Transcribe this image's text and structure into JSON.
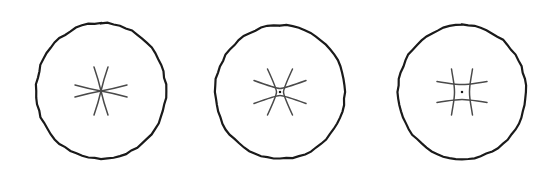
{
  "figure": {
    "title": "",
    "caption": "",
    "width": 553,
    "height": 171,
    "background_color": "#ffffff",
    "stroke_color": "#1a1a1a",
    "inner_stroke_color": "#4a4a4a",
    "outline_stroke_width": 2.1,
    "inner_stroke_width": 1.5,
    "panel_count": 3,
    "labels": [],
    "panels": [
      {
        "id": "panel-1",
        "name": "circle-with-pinched-star",
        "order": 1,
        "outline": {
          "shape": "circle",
          "cx": 101,
          "cy": 91,
          "rx": 65,
          "ry": 68,
          "stroke_width": 2.2,
          "stroke_color": "#1a1a1a",
          "fill": "none"
        },
        "inner_mark": {
          "kind": "pinched-star",
          "cx": 101,
          "cy": 91,
          "vertical_lines": 2,
          "horizontal_lines": 2,
          "cell_width": 0,
          "cell_height": 0,
          "center_dot": false,
          "vertical_half_length": 24,
          "horizontal_half_length": 26,
          "vertical_spread": 7,
          "horizontal_spread": 6,
          "stroke_width": 1.5,
          "stroke_color": "#4a4a4a",
          "description": "two curved vertical strokes pinching to a single waist crossed by two curved horizontal strokes"
        }
      },
      {
        "id": "panel-2",
        "name": "circle-with-small-grid",
        "order": 2,
        "outline": {
          "shape": "circle",
          "cx": 280,
          "cy": 92,
          "rx": 65,
          "ry": 67,
          "stroke_width": 2.2,
          "stroke_color": "#1a1a1a",
          "fill": "none"
        },
        "inner_mark": {
          "kind": "grid-with-dot",
          "cx": 280,
          "cy": 92,
          "vertical_lines": 2,
          "horizontal_lines": 2,
          "cell_width": 7,
          "cell_height": 7,
          "center_dot": true,
          "center_dot_size": 2.2,
          "vertical_half_length": 23,
          "horizontal_half_length": 26,
          "vertical_spread": 9,
          "horizontal_spread": 8,
          "stroke_width": 1.5,
          "stroke_color": "#4a4a4a",
          "description": "tight hash of two curved verticals and two curved horizontals enclosing a small central cell with a dot"
        }
      },
      {
        "id": "panel-3",
        "name": "circle-with-open-grid",
        "order": 3,
        "outline": {
          "shape": "circle",
          "cx": 462,
          "cy": 92,
          "rx": 64,
          "ry": 67,
          "stroke_width": 2.2,
          "stroke_color": "#1a1a1a",
          "fill": "none"
        },
        "inner_mark": {
          "kind": "grid-with-dot",
          "cx": 462,
          "cy": 92,
          "vertical_lines": 2,
          "horizontal_lines": 2,
          "cell_width": 15,
          "cell_height": 15,
          "center_dot": true,
          "center_dot_size": 2.2,
          "vertical_half_length": 23,
          "horizontal_half_length": 25,
          "vertical_spread": 3,
          "horizontal_spread": 3,
          "stroke_width": 1.5,
          "stroke_color": "#4a4a4a",
          "description": "wider square grid of two curved verticals and two curved horizontals enclosing a large central cell with a dot"
        }
      }
    ]
  }
}
